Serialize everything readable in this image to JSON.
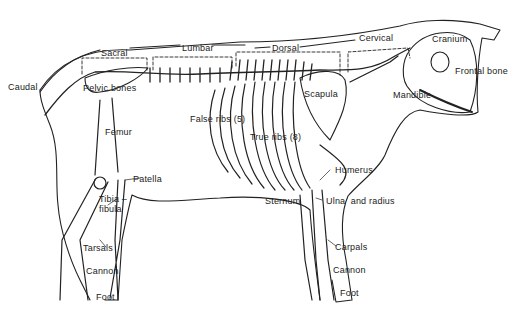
{
  "diagram": {
    "type": "anatomical-illustration",
    "region_labels": [
      {
        "id": "caudal",
        "text": "Caudal",
        "x": 8,
        "y": 82
      },
      {
        "id": "sacral",
        "text": "Sacral",
        "x": 101,
        "y": 48
      },
      {
        "id": "lumbar",
        "text": "Lumbar",
        "x": 182,
        "y": 43
      },
      {
        "id": "dorsal",
        "text": "Dorsal",
        "x": 272,
        "y": 43
      },
      {
        "id": "cervical",
        "text": "Cervical",
        "x": 359,
        "y": 33
      }
    ],
    "bone_labels": [
      {
        "id": "pelvic-bones",
        "text": "Pelvic bones",
        "x": 83,
        "y": 83
      },
      {
        "id": "cranium",
        "text": "Cranium",
        "x": 432,
        "y": 34
      },
      {
        "id": "frontal-bone",
        "text": "Frontal bone",
        "x": 455,
        "y": 66
      },
      {
        "id": "mandible",
        "text": "Mandible",
        "x": 393,
        "y": 90
      },
      {
        "id": "scapula",
        "text": "Scapula",
        "x": 304,
        "y": 89
      },
      {
        "id": "false-ribs",
        "text": "False ribs (5)",
        "x": 190,
        "y": 114
      },
      {
        "id": "true-ribs",
        "text": "True ribs (8)",
        "x": 250,
        "y": 132
      },
      {
        "id": "femur",
        "text": "Femur",
        "x": 105,
        "y": 127
      },
      {
        "id": "patella",
        "text": "Patella",
        "x": 133,
        "y": 174
      },
      {
        "id": "tibia-fibula",
        "text": "Tibia –\nfibula",
        "x": 99,
        "y": 194
      },
      {
        "id": "humerus",
        "text": "Humerus",
        "x": 335,
        "y": 165
      },
      {
        "id": "sternum",
        "text": "Sternum",
        "x": 265,
        "y": 196
      },
      {
        "id": "ulna-radius",
        "text": "Ulna  and radius",
        "x": 326,
        "y": 196
      },
      {
        "id": "tarsals",
        "text": "Tarsals",
        "x": 83,
        "y": 243
      },
      {
        "id": "cannon-hind",
        "text": "Cannon",
        "x": 86,
        "y": 266
      },
      {
        "id": "foot-hind",
        "text": "Foot",
        "x": 96,
        "y": 292
      },
      {
        "id": "carpals",
        "text": "Carpals",
        "x": 335,
        "y": 242
      },
      {
        "id": "cannon-fore",
        "text": "Cannon",
        "x": 333,
        "y": 265
      },
      {
        "id": "foot-fore",
        "text": "Foot",
        "x": 340,
        "y": 288
      }
    ],
    "colors": {
      "ink": "#222222",
      "background": "#ffffff"
    }
  }
}
